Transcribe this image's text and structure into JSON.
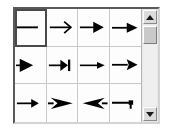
{
  "panel": {
    "name": "arrow-style-picker",
    "columns": 4,
    "rows": 3,
    "selected_index": 0,
    "line_color": "#000000",
    "cell_background": "#fdfdfd",
    "grid_line_color": "#c8c8c8",
    "selection_border_color": "#4a4a4a"
  },
  "arrow_styles": [
    {
      "index": 0,
      "label": "None",
      "icon": "line-plain",
      "selected": true
    },
    {
      "index": 1,
      "label": "Arrow",
      "icon": "arrow-open-thin",
      "selected": false
    },
    {
      "index": 2,
      "label": "Arrow concave",
      "icon": "arrow-filled-small",
      "selected": false
    },
    {
      "index": 3,
      "label": "Arrow filled",
      "icon": "arrow-filled",
      "selected": false
    },
    {
      "index": 4,
      "label": "Triangle",
      "icon": "arrow-triangle-left-edge",
      "selected": false
    },
    {
      "index": 5,
      "label": "Line arrow",
      "icon": "arrow-with-bar",
      "selected": false
    },
    {
      "index": 6,
      "label": "Arrow small",
      "icon": "arrow-slim-filled",
      "selected": false
    },
    {
      "index": 7,
      "label": "Dimension line arrow",
      "icon": "arrow-wedge",
      "selected": false
    },
    {
      "index": 8,
      "label": "Square",
      "icon": "arrow-short-filled",
      "selected": false
    },
    {
      "index": 9,
      "label": "Concave right",
      "icon": "arrow-swept-right",
      "selected": false
    },
    {
      "index": 10,
      "label": "Concave left",
      "icon": "arrow-swept-left",
      "selected": false
    },
    {
      "index": 11,
      "label": "Half arrow",
      "icon": "line-hook-end",
      "selected": false
    }
  ],
  "scrollbar": {
    "name": "vertical-scrollbar",
    "up_arrow": "triangle-up-icon",
    "down_arrow": "triangle-down-icon",
    "thumb_position_percent": 2,
    "thumb_size_percent": 22,
    "orientation": "vertical"
  }
}
